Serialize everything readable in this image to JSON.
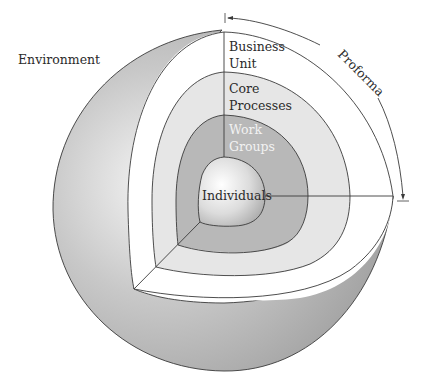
{
  "diagram": {
    "type": "nested-sphere-cutaway",
    "labels": {
      "environment": "Environment",
      "proforma": "Proforma",
      "layers": [
        {
          "id": "business-unit",
          "line1": "Business",
          "line2": "Unit"
        },
        {
          "id": "core-processes",
          "line1": "Core",
          "line2": "Processes"
        },
        {
          "id": "work-groups",
          "line1": "Work",
          "line2": "Groups"
        },
        {
          "id": "individuals",
          "line1": "Individuals"
        }
      ]
    },
    "colors": {
      "sphere_shell": "#b3b3b3",
      "business_unit": "#ffffff",
      "core_processes": "#e6e6e6",
      "work_groups": "#b8b8b8",
      "individuals_core": "#e0e0e0",
      "outline": "#3a3a3a",
      "work_groups_text": "#f2f2f2"
    }
  }
}
